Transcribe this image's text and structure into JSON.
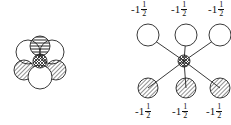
{
  "left_figure": {
    "description": "compact overlapping sphere cluster",
    "center_pattern": "crosshatch",
    "top_pattern": "horizontal-stripes",
    "side_pattern": "diagonal-stripes"
  },
  "right_figure": {
    "top_labels": [
      {
        "whole": "-1",
        "num": "1",
        "den": "2"
      },
      {
        "whole": "-1",
        "num": "1",
        "den": "2"
      },
      {
        "whole": "-1",
        "num": "1",
        "den": "2"
      }
    ],
    "bottom_labels": [
      {
        "whole": "-1",
        "num": "1",
        "den": "2"
      },
      {
        "whole": "-1",
        "num": "1",
        "den": "2"
      },
      {
        "whole": "-1",
        "num": "1",
        "den": "2"
      }
    ]
  }
}
